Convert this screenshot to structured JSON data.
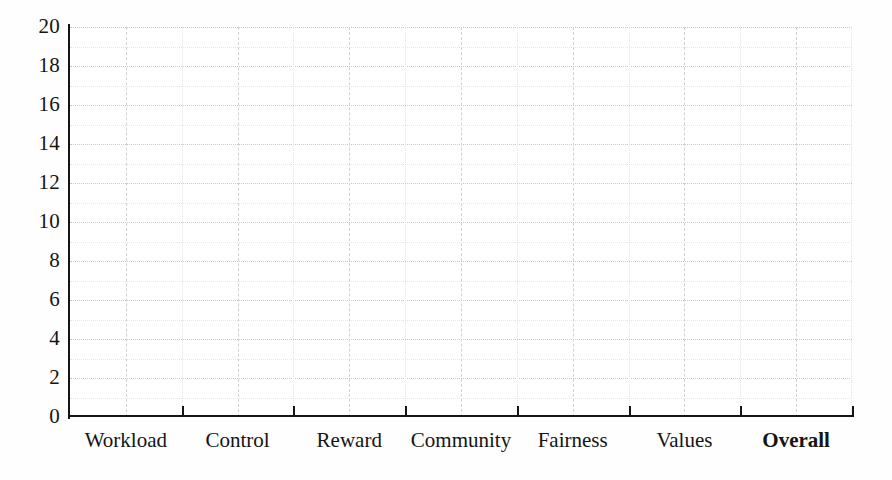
{
  "chart_data": {
    "type": "bar",
    "title": "",
    "subtitle": "",
    "xlabel": "",
    "ylabel": "",
    "categories": [
      "Workload",
      "Control",
      "Reward",
      "Community",
      "Fairness",
      "Values",
      "Overall"
    ],
    "values": [
      null,
      null,
      null,
      null,
      null,
      null,
      null
    ],
    "series": [
      {
        "name": "",
        "values": [
          null,
          null,
          null,
          null,
          null,
          null,
          null
        ]
      }
    ],
    "ylim": [
      0,
      20
    ],
    "ytick_step": 2,
    "yticks": [
      0,
      2,
      4,
      6,
      8,
      10,
      12,
      14,
      16,
      18,
      20
    ],
    "ytick_labels": [
      "0",
      "2",
      "4",
      "6",
      "8",
      "10",
      "12",
      "14",
      "16",
      "18",
      "20"
    ],
    "grid": true,
    "grid_horizontal": true,
    "grid_vertical": true,
    "grid_minor": true,
    "legend": false,
    "legend_position": "none",
    "emphasized_categories": [
      "Overall"
    ],
    "colors": {
      "background": "#ffffff",
      "axis": "#151515",
      "gridline_major": "#c9c9c9",
      "gridline_minor": "#e6e6e6",
      "text": "#141414"
    }
  }
}
